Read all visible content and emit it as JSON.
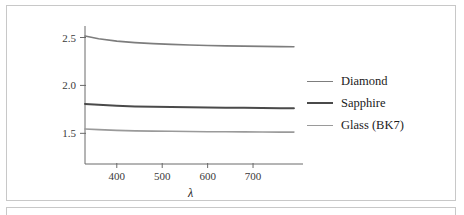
{
  "figure": {
    "name": "refractive-index-dispersion-plot",
    "axis_label_x": "λ",
    "axis_label_y": ""
  },
  "legend": {
    "position": "right",
    "entries": [
      {
        "label": "Diamond",
        "color": "#7d7d7d",
        "width": 1.6
      },
      {
        "label": "Sapphire",
        "color": "#4a4a4a",
        "width": 2.0
      },
      {
        "label": "Glass (BK7)",
        "color": "#9a9a9a",
        "width": 1.6
      }
    ]
  },
  "axes": {
    "x_ticks": [
      "400",
      "500",
      "600",
      "700"
    ],
    "y_ticks": [
      "2.5",
      "2.0",
      "1.5"
    ],
    "x_tick_values": [
      400,
      500,
      600,
      700
    ],
    "y_tick_values": [
      2.5,
      2.0,
      1.5
    ],
    "x_range": [
      330,
      810
    ],
    "y_range": [
      1.18,
      2.62
    ],
    "grid": false
  },
  "colors": {
    "frame_border": "#c8c8c8",
    "axis": "#6a6a6a",
    "text": "#1b1b1b",
    "background": "#ffffff"
  },
  "chart_data": {
    "type": "line",
    "title": "",
    "subtitle": "",
    "xlabel": "λ",
    "ylabel": "",
    "xlim": [
      330,
      810
    ],
    "ylim": [
      1.18,
      2.62
    ],
    "grid": false,
    "legend_position": "right",
    "x": [
      330,
      360,
      400,
      440,
      480,
      520,
      560,
      600,
      640,
      680,
      720,
      760,
      790
    ],
    "series": [
      {
        "name": "Diamond",
        "color": "#7d7d7d",
        "values": [
          2.515,
          2.487,
          2.462,
          2.447,
          2.436,
          2.428,
          2.422,
          2.417,
          2.413,
          2.41,
          2.407,
          2.405,
          2.404
        ]
      },
      {
        "name": "Sapphire",
        "color": "#4a4a4a",
        "values": [
          1.807,
          1.797,
          1.787,
          1.781,
          1.777,
          1.774,
          1.771,
          1.769,
          1.767,
          1.766,
          1.764,
          1.763,
          1.762
        ]
      },
      {
        "name": "Glass (BK7)",
        "color": "#9a9a9a",
        "values": [
          1.545,
          1.539,
          1.531,
          1.526,
          1.523,
          1.521,
          1.519,
          1.517,
          1.516,
          1.515,
          1.514,
          1.513,
          1.513
        ]
      }
    ]
  }
}
